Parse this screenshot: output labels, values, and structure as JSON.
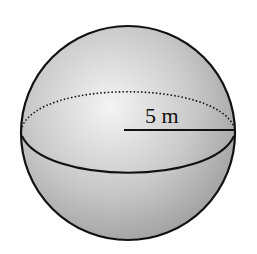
{
  "diagram": {
    "shape": "sphere",
    "radius_label": "5 m",
    "colors": {
      "outline": "#111111",
      "shade_light": "#f2f2f2",
      "shade_dark": "#9a9a9a",
      "background": "#ffffff"
    }
  }
}
